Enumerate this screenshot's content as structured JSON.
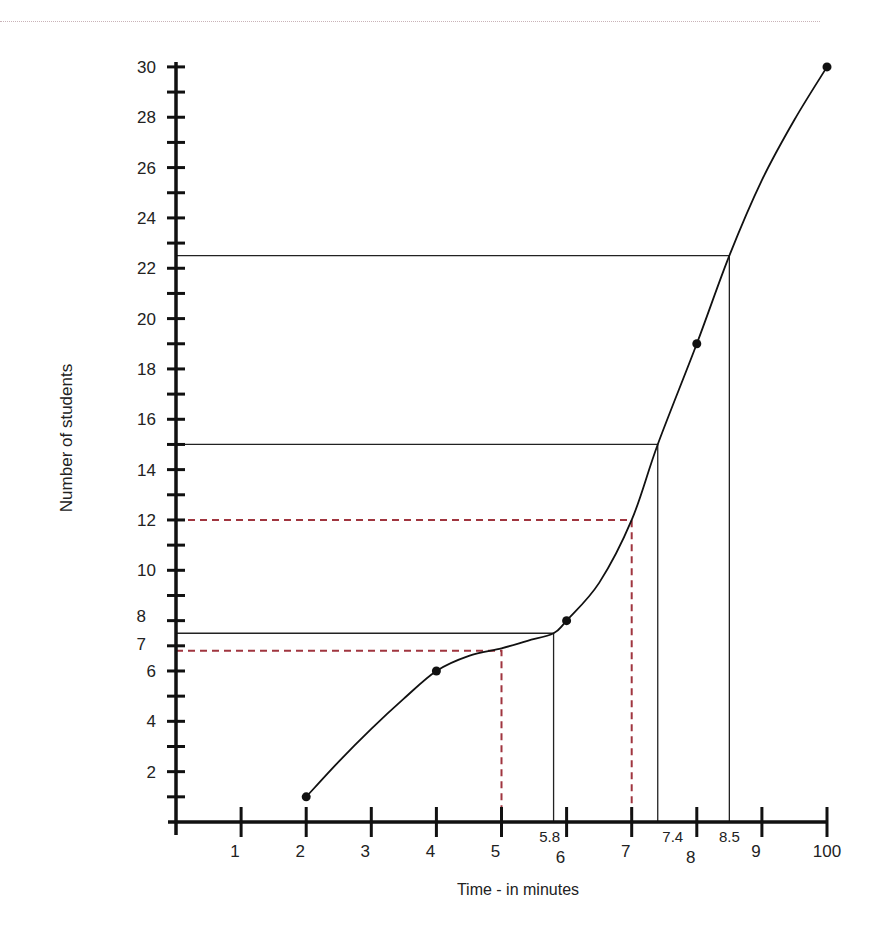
{
  "chart_data": {
    "type": "line",
    "title": "",
    "xlabel": "Time - in minutes",
    "ylabel": "Number of students",
    "xlim": [
      0,
      10
    ],
    "ylim": [
      0,
      30
    ],
    "grid": false,
    "x_tick_labels": [
      {
        "value": 1,
        "label": "1"
      },
      {
        "value": 2,
        "label": "2"
      },
      {
        "value": 3,
        "label": "3"
      },
      {
        "value": 4,
        "label": "4"
      },
      {
        "value": 5,
        "label": "5"
      },
      {
        "value": 6,
        "label": "6"
      },
      {
        "value": 7,
        "label": "7"
      },
      {
        "value": 8,
        "label": "8"
      },
      {
        "value": 9,
        "label": "9"
      },
      {
        "value": 10,
        "label": "100"
      }
    ],
    "y_tick_labels": [
      {
        "value": 2,
        "label": "2"
      },
      {
        "value": 4,
        "label": "4"
      },
      {
        "value": 6,
        "label": "6"
      },
      {
        "value": 7,
        "label": "7"
      },
      {
        "value": 8,
        "label": "8"
      },
      {
        "value": 10,
        "label": "10"
      },
      {
        "value": 12,
        "label": "12"
      },
      {
        "value": 14,
        "label": "14"
      },
      {
        "value": 16,
        "label": "16"
      },
      {
        "value": 18,
        "label": "18"
      },
      {
        "value": 20,
        "label": "20"
      },
      {
        "value": 22,
        "label": "22"
      },
      {
        "value": 24,
        "label": "24"
      },
      {
        "value": 26,
        "label": "26"
      },
      {
        "value": 28,
        "label": "28"
      },
      {
        "value": 30,
        "label": "30"
      }
    ],
    "series": [
      {
        "name": "Cumulative frequency",
        "x": [
          2,
          4,
          6,
          8,
          10
        ],
        "y": [
          1,
          6,
          8,
          19,
          30
        ],
        "smooth": true,
        "color": "#111111"
      }
    ],
    "curve_path_points": [
      [
        2,
        1
      ],
      [
        2.5,
        2.4
      ],
      [
        3,
        3.7
      ],
      [
        3.5,
        4.9
      ],
      [
        4,
        6
      ],
      [
        4.5,
        6.6
      ],
      [
        5,
        6.9
      ],
      [
        5.4,
        7.2
      ],
      [
        5.8,
        7.5
      ],
      [
        6,
        8
      ],
      [
        6.5,
        9.5
      ],
      [
        7,
        12
      ],
      [
        7.4,
        15
      ],
      [
        8,
        19
      ],
      [
        8.5,
        22.5
      ],
      [
        9,
        25.5
      ],
      [
        9.5,
        27.9
      ],
      [
        10,
        30
      ]
    ],
    "reference_lines": [
      {
        "x": 5.8,
        "y": 7.5,
        "style": "solid",
        "color": "#222222",
        "x_label": "5.8"
      },
      {
        "x": 7.4,
        "y": 15,
        "style": "solid",
        "color": "#222222",
        "x_label": "7.4"
      },
      {
        "x": 8.5,
        "y": 22.5,
        "style": "solid",
        "color": "#222222",
        "x_label": "8.5"
      },
      {
        "x": 5,
        "y": 6.8,
        "style": "dashed",
        "color": "#a0353f",
        "x_label": ""
      },
      {
        "x": 7,
        "y": 12,
        "style": "dashed",
        "color": "#a0353f",
        "x_label": ""
      }
    ],
    "colors": {
      "axis": "#111111",
      "curve": "#111111",
      "solid_guides": "#222222",
      "dashed_guides": "#a0353f",
      "text": "#222222"
    }
  }
}
